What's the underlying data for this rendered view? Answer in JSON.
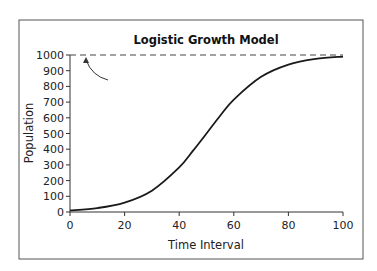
{
  "chart_data": {
    "type": "line",
    "title": "Logistic Growth Model",
    "xlabel": "Time Interval",
    "ylabel": "Population",
    "xlim": [
      0,
      100
    ],
    "ylim": [
      0,
      1000
    ],
    "xticks": [
      0,
      20,
      40,
      60,
      80,
      100
    ],
    "yticks": [
      0,
      100,
      200,
      300,
      400,
      500,
      600,
      700,
      800,
      900,
      1000
    ],
    "grid": false,
    "legend": null,
    "series": [
      {
        "name": "Population",
        "style": "solid",
        "x": [
          0,
          10,
          20,
          30,
          40,
          45,
          50,
          55,
          60,
          70,
          80,
          90,
          100
        ],
        "values": [
          10,
          25,
          60,
          136,
          284,
          389,
          500,
          613,
          716,
          861,
          939,
          975,
          990
        ]
      },
      {
        "name": "Carrying capacity",
        "style": "dashed",
        "x": [
          0,
          100
        ],
        "values": [
          1000,
          1000
        ]
      }
    ],
    "annotations": [
      {
        "type": "arrow",
        "points_to": "carrying capacity line at x≈5, y=1000",
        "text": ""
      }
    ]
  },
  "colors": {
    "line": "#1a1a1a",
    "axis": "#333333",
    "frame": "#555555",
    "background": "#ffffff"
  }
}
